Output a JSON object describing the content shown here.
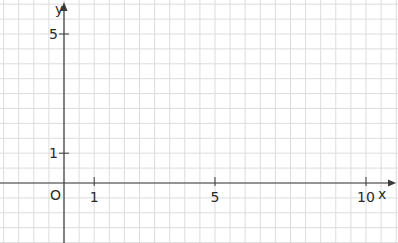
{
  "chart_data": {
    "type": "scatter",
    "title": "",
    "xlabel": "x",
    "ylabel": "y",
    "origin_label": "O",
    "x_ticks": [
      {
        "value": 1,
        "label": "1"
      },
      {
        "value": 5,
        "label": "5"
      },
      {
        "value": 10,
        "label": "10"
      }
    ],
    "y_ticks": [
      {
        "value": 1,
        "label": "1"
      },
      {
        "value": 5,
        "label": "5"
      }
    ],
    "xlim": [
      -2,
      11
    ],
    "ylim": [
      -2,
      6
    ],
    "grid": true,
    "grid_step": 0.5,
    "series": []
  },
  "colors": {
    "grid": "#dcdcdc",
    "axis": "#3a3a3a",
    "background": "#ffffff"
  }
}
